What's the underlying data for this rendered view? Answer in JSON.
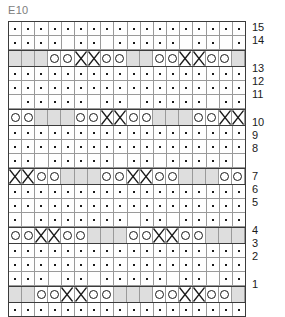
{
  "header": {
    "title": "E10"
  },
  "chart_data": {
    "type": "table",
    "title": "E10",
    "xlabel": "",
    "ylabel": "",
    "columns": 18,
    "legend_position": "right",
    "grid": true,
    "symbol_legend": {
      "dot": "purl / knit stitch dot",
      "circle": "yarn over",
      "cross": "decrease / crossed stitch",
      "blank": "no stitch"
    },
    "colors": {
      "pattern_row_background": "#dedede",
      "grid_line": "#9a9a9a",
      "border": "#3b3b3b",
      "symbol": "#1a1a1a",
      "title": "#7d7d7d",
      "page_background": "#ffffff"
    },
    "row_labels": [
      "15",
      "14",
      "",
      "13",
      "12",
      "11",
      "",
      "10",
      "9",
      "8",
      "",
      "7",
      "6",
      "5",
      "",
      "4",
      "3",
      "2",
      "",
      "1"
    ],
    "rows": [
      {
        "label": "15",
        "kind": "stitch",
        "cells": [
          "dot",
          "dot",
          "dot",
          "dot",
          "dot",
          "dot",
          "dot",
          "dot",
          "dot",
          "dot",
          "dot",
          "dot",
          "dot",
          "dot",
          "dot",
          "dot",
          "dot",
          "dot"
        ]
      },
      {
        "label": "14",
        "kind": "stitch",
        "cells": [
          "dot",
          "dot",
          "dot",
          "dot",
          "blank",
          "dot",
          "dot",
          "blank",
          "dot",
          "dot",
          "dot",
          "dot",
          "dot",
          "blank",
          "dot",
          "dot",
          "blank",
          "dot"
        ]
      },
      {
        "label": "",
        "kind": "pattern",
        "cells": [
          "blank",
          "blank",
          "blank",
          "circle",
          "circle",
          "cross",
          "cross",
          "circle",
          "circle",
          "blank",
          "blank",
          "circle",
          "circle",
          "cross",
          "cross",
          "circle",
          "circle",
          "blank"
        ]
      },
      {
        "label": "13",
        "kind": "stitch",
        "cells": [
          "dot",
          "dot",
          "dot",
          "dot",
          "dot",
          "dot",
          "dot",
          "dot",
          "dot",
          "dot",
          "dot",
          "dot",
          "dot",
          "dot",
          "dot",
          "dot",
          "dot",
          "dot"
        ]
      },
      {
        "label": "12",
        "kind": "stitch",
        "cells": [
          "dot",
          "dot",
          "dot",
          "dot",
          "dot",
          "dot",
          "dot",
          "dot",
          "dot",
          "dot",
          "dot",
          "dot",
          "dot",
          "dot",
          "dot",
          "dot",
          "dot",
          "dot"
        ]
      },
      {
        "label": "11",
        "kind": "stitch",
        "cells": [
          "blank",
          "dot",
          "dot",
          "dot",
          "dot",
          "dot",
          "blank",
          "dot",
          "dot",
          "blank",
          "dot",
          "dot",
          "dot",
          "dot",
          "dot",
          "blank",
          "dot",
          "dot"
        ]
      },
      {
        "label": "",
        "kind": "pattern",
        "cells": [
          "circle",
          "circle",
          "blank",
          "blank",
          "blank",
          "circle",
          "circle",
          "cross",
          "cross",
          "circle",
          "circle",
          "blank",
          "blank",
          "blank",
          "circle",
          "circle",
          "cross",
          "cross"
        ]
      },
      {
        "label": "10",
        "kind": "stitch",
        "cells": [
          "dot",
          "dot",
          "dot",
          "dot",
          "dot",
          "dot",
          "dot",
          "dot",
          "dot",
          "dot",
          "dot",
          "dot",
          "dot",
          "dot",
          "dot",
          "dot",
          "dot",
          "dot"
        ]
      },
      {
        "label": "9",
        "kind": "stitch",
        "cells": [
          "dot",
          "dot",
          "dot",
          "dot",
          "dot",
          "dot",
          "dot",
          "dot",
          "dot",
          "dot",
          "dot",
          "dot",
          "dot",
          "dot",
          "dot",
          "dot",
          "dot",
          "dot"
        ]
      },
      {
        "label": "8",
        "kind": "stitch",
        "cells": [
          "dot",
          "dot",
          "blank",
          "dot",
          "dot",
          "dot",
          "dot",
          "dot",
          "blank",
          "dot",
          "dot",
          "blank",
          "dot",
          "dot",
          "dot",
          "dot",
          "dot",
          "blank"
        ]
      },
      {
        "label": "",
        "kind": "pattern",
        "cells": [
          "cross",
          "cross",
          "circle",
          "circle",
          "blank",
          "blank",
          "blank",
          "circle",
          "circle",
          "cross",
          "cross",
          "circle",
          "circle",
          "blank",
          "blank",
          "blank",
          "circle",
          "circle"
        ]
      },
      {
        "label": "7",
        "kind": "stitch",
        "cells": [
          "dot",
          "dot",
          "dot",
          "dot",
          "dot",
          "dot",
          "dot",
          "dot",
          "dot",
          "dot",
          "dot",
          "dot",
          "dot",
          "dot",
          "dot",
          "dot",
          "dot",
          "dot"
        ]
      },
      {
        "label": "6",
        "kind": "stitch",
        "cells": [
          "dot",
          "dot",
          "dot",
          "dot",
          "dot",
          "dot",
          "dot",
          "dot",
          "dot",
          "dot",
          "dot",
          "dot",
          "dot",
          "dot",
          "dot",
          "dot",
          "dot",
          "dot"
        ]
      },
      {
        "label": "5",
        "kind": "stitch",
        "cells": [
          "dot",
          "blank",
          "dot",
          "dot",
          "dot",
          "dot",
          "dot",
          "dot",
          "dot",
          "blank",
          "dot",
          "dot",
          "blank",
          "dot",
          "dot",
          "dot",
          "dot",
          "dot"
        ]
      },
      {
        "label": "",
        "kind": "pattern",
        "cells": [
          "circle",
          "circle",
          "cross",
          "cross",
          "circle",
          "circle",
          "blank",
          "blank",
          "blank",
          "circle",
          "circle",
          "cross",
          "cross",
          "circle",
          "circle",
          "blank",
          "blank",
          "blank"
        ]
      },
      {
        "label": "4",
        "kind": "stitch",
        "cells": [
          "dot",
          "dot",
          "dot",
          "dot",
          "dot",
          "dot",
          "dot",
          "dot",
          "dot",
          "dot",
          "dot",
          "dot",
          "dot",
          "dot",
          "dot",
          "dot",
          "dot",
          "dot"
        ]
      },
      {
        "label": "3",
        "kind": "stitch",
        "cells": [
          "dot",
          "dot",
          "dot",
          "dot",
          "dot",
          "dot",
          "dot",
          "dot",
          "dot",
          "dot",
          "dot",
          "dot",
          "dot",
          "dot",
          "dot",
          "dot",
          "dot",
          "dot"
        ]
      },
      {
        "label": "2",
        "kind": "stitch",
        "cells": [
          "dot",
          "dot",
          "dot",
          "blank",
          "dot",
          "dot",
          "blank",
          "dot",
          "dot",
          "dot",
          "dot",
          "dot",
          "blank",
          "dot",
          "dot",
          "blank",
          "dot",
          "dot"
        ]
      },
      {
        "label": "",
        "kind": "pattern",
        "cells": [
          "blank",
          "blank",
          "circle",
          "circle",
          "cross",
          "cross",
          "circle",
          "circle",
          "blank",
          "blank",
          "blank",
          "circle",
          "circle",
          "cross",
          "cross",
          "circle",
          "circle",
          "blank"
        ]
      },
      {
        "label": "1",
        "kind": "stitch",
        "cells": [
          "dot",
          "dot",
          "dot",
          "dot",
          "dot",
          "dot",
          "dot",
          "dot",
          "dot",
          "dot",
          "dot",
          "dot",
          "dot",
          "dot",
          "dot",
          "dot",
          "dot",
          "dot"
        ]
      }
    ]
  }
}
